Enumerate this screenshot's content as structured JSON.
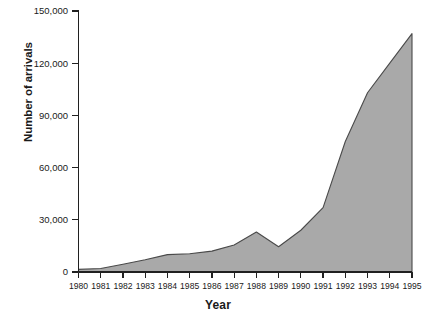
{
  "chart_data": {
    "type": "area",
    "title": "",
    "xlabel": "Year",
    "ylabel": "Number of arrivals",
    "categories": [
      "1980",
      "1981",
      "1982",
      "1983",
      "1984",
      "1985",
      "1986",
      "1987",
      "1988",
      "1989",
      "1990",
      "1991",
      "1992",
      "1993",
      "1994",
      "1995"
    ],
    "values": [
      1500,
      2000,
      4500,
      7000,
      10000,
      10500,
      12000,
      15500,
      23000,
      14500,
      24000,
      37000,
      75000,
      103000,
      120000,
      137000
    ],
    "series": [
      {
        "name": "Number of arrivals",
        "values": [
          1500,
          2000,
          4500,
          7000,
          10000,
          10500,
          12000,
          15500,
          23000,
          14500,
          24000,
          37000,
          75000,
          103000,
          120000,
          137000
        ]
      }
    ],
    "x": [
      1980,
      1981,
      1982,
      1983,
      1984,
      1985,
      1986,
      1987,
      1988,
      1989,
      1990,
      1991,
      1992,
      1993,
      1994,
      1995
    ],
    "ylim": [
      0,
      150000
    ],
    "xlim": [
      1980,
      1995
    ],
    "y_ticks": [
      0,
      30000,
      60000,
      90000,
      120000,
      150000
    ],
    "y_tick_labels": [
      "0",
      "30,000",
      "60,000",
      "90,000",
      "120,000",
      "150,000"
    ],
    "x_ticks": [
      1980,
      1981,
      1982,
      1983,
      1984,
      1985,
      1986,
      1987,
      1988,
      1989,
      1990,
      1991,
      1992,
      1993,
      1994,
      1995
    ],
    "x_tick_labels": [
      "1980",
      "1981",
      "1982",
      "1983",
      "1984",
      "1985",
      "1986",
      "1987",
      "1988",
      "1989",
      "1990",
      "1991",
      "1992",
      "1993",
      "1994",
      "1995"
    ],
    "grid": false,
    "legend": false,
    "legend_position": "none",
    "fill_color": "#a9a9a9",
    "line_color": "#4a4a4a",
    "axis_color": "#202020",
    "background": "#ffffff",
    "annotations": []
  }
}
